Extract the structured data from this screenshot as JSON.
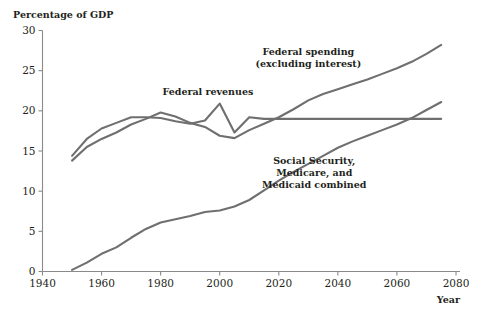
{
  "chart_data": {
    "type": "line",
    "title": "",
    "xlabel": "Year",
    "ylabel": "Percentage of GDP",
    "xlim": [
      1940,
      2080
    ],
    "ylim": [
      0,
      30
    ],
    "xticks": [
      1940,
      1960,
      1980,
      2000,
      2020,
      2040,
      2060,
      2080
    ],
    "xtick_labels": [
      "1940",
      "1960",
      "1980",
      "2000",
      "2020",
      "2040",
      "2060",
      "2080"
    ],
    "yticks": [
      0,
      5,
      10,
      15,
      20,
      25,
      30
    ],
    "ytick_labels": [
      "0",
      "5",
      "10",
      "15",
      "20",
      "25",
      "30"
    ],
    "grid": false,
    "legend_position": "inline-annotations",
    "line_color": "#6f6f6f",
    "axis_color": "#8a8a8a",
    "text_color": "#231f20",
    "series": [
      {
        "name": "Federal spending (excluding interest)",
        "x": [
          1950,
          1955,
          1960,
          1965,
          1970,
          1975,
          1980,
          1985,
          1990,
          1995,
          2000,
          2005,
          2010,
          2015,
          2020,
          2025,
          2030,
          2035,
          2040,
          2045,
          2050,
          2055,
          2060,
          2065,
          2070,
          2075
        ],
        "values": [
          13.8,
          15.5,
          16.5,
          17.3,
          18.3,
          19.0,
          19.8,
          19.3,
          18.5,
          18.0,
          16.9,
          16.6,
          17.6,
          18.4,
          19.2,
          20.2,
          21.3,
          22.1,
          22.7,
          23.3,
          23.9,
          24.6,
          25.3,
          26.1,
          27.1,
          28.2
        ]
      },
      {
        "name": "Federal revenues",
        "x": [
          1950,
          1955,
          1960,
          1965,
          1970,
          1975,
          1980,
          1985,
          1990,
          1995,
          2000,
          2005,
          2010,
          2015,
          2020,
          2030,
          2040,
          2050,
          2060,
          2070,
          2075
        ],
        "values": [
          14.4,
          16.5,
          17.8,
          18.5,
          19.2,
          19.2,
          19.1,
          18.7,
          18.4,
          18.8,
          20.9,
          17.3,
          19.2,
          19.0,
          19.0,
          19.0,
          19.0,
          19.0,
          19.0,
          19.0,
          19.0
        ]
      },
      {
        "name": "Social Security, Medicare, and Medicaid combined",
        "x": [
          1950,
          1955,
          1960,
          1965,
          1970,
          1975,
          1980,
          1985,
          1990,
          1995,
          2000,
          2005,
          2010,
          2015,
          2020,
          2025,
          2030,
          2035,
          2040,
          2045,
          2050,
          2055,
          2060,
          2065,
          2070,
          2075
        ],
        "values": [
          0.2,
          1.1,
          2.2,
          3.0,
          4.2,
          5.3,
          6.1,
          6.5,
          6.9,
          7.4,
          7.6,
          8.1,
          8.9,
          10.1,
          11.3,
          12.4,
          13.4,
          14.4,
          15.4,
          16.2,
          16.9,
          17.6,
          18.3,
          19.1,
          20.1,
          21.1
        ]
      }
    ],
    "annotations": [
      {
        "id": "annotation-federal-spending",
        "lines": [
          "Federal spending",
          "(excluding interest)"
        ],
        "x": 2030,
        "y": 27.0
      },
      {
        "id": "annotation-federal-revenues",
        "lines": [
          "Federal revenues"
        ],
        "x": 1996,
        "y": 22.0
      },
      {
        "id": "annotation-entitlements",
        "lines": [
          "Social Security,",
          "Medicare, and",
          "Medicaid combined"
        ],
        "x": 2032,
        "y": 13.4
      }
    ]
  }
}
